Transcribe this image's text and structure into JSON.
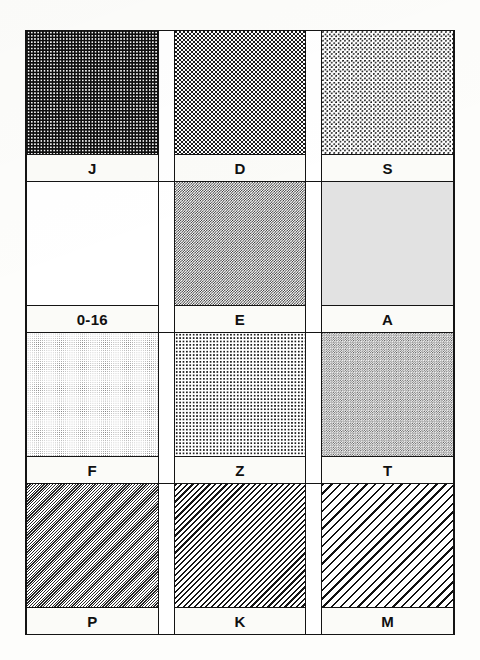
{
  "document": {
    "kind": "pattern-swatch-chart",
    "columns": 3,
    "rows": 4,
    "background_color": "#fdfdfb",
    "frame_color": "#141414",
    "label_band_color": "#fbfbf8",
    "label_text_color": "#101010"
  },
  "chart_data": {
    "type": "table",
    "title": "",
    "xlabel": "",
    "ylabel": "",
    "categories": [
      "J",
      "D",
      "S",
      "0-16",
      "E",
      "A",
      "F",
      "Z",
      "T",
      "P",
      "K",
      "M"
    ],
    "values": [
      78,
      48,
      28,
      16,
      50,
      12,
      20,
      22,
      18,
      46,
      44,
      30
    ],
    "series": [
      {
        "name": "ink coverage percent",
        "values": [
          78,
          48,
          28,
          16,
          50,
          12,
          20,
          22,
          18,
          46,
          44,
          30
        ]
      }
    ],
    "legend": [],
    "grid": true
  },
  "grid": {
    "rows": [
      {
        "row_index": 1,
        "cells": [
          {
            "label": "J",
            "pattern": "dense-coarse-checker-dot",
            "pattern_class": "pat-dense-checker",
            "coverage": 78
          },
          {
            "label": "D",
            "pattern": "medium-coarse-dot",
            "pattern_class": "pat-medium-dot",
            "coverage": 48
          },
          {
            "label": "S",
            "pattern": "light-coarse-dot",
            "pattern_class": "pat-light-dot",
            "coverage": 28
          }
        ]
      },
      {
        "row_index": 2,
        "cells": [
          {
            "label": "0-16",
            "pattern": "very-fine-pale-dot-grid",
            "pattern_class": "pat-fine-pale",
            "coverage": 16
          },
          {
            "label": "E",
            "pattern": "fine-mid-checker",
            "pattern_class": "pat-fine-checker",
            "coverage": 50
          },
          {
            "label": "A",
            "pattern": "ultra-fine-near-solid-gray",
            "pattern_class": "pat-ultrafine-gray",
            "coverage": 12
          }
        ]
      },
      {
        "row_index": 3,
        "cells": [
          {
            "label": "F",
            "pattern": "fine-light-gray-grid",
            "pattern_class": "pat-fine-lightgray",
            "coverage": 20
          },
          {
            "label": "Z",
            "pattern": "sparse-small-dot",
            "pattern_class": "pat-sparse-dot",
            "coverage": 22
          },
          {
            "label": "T",
            "pattern": "fine-light-checker",
            "pattern_class": "pat-fine-check-light",
            "coverage": 18
          }
        ]
      },
      {
        "row_index": 4,
        "cells": [
          {
            "label": "P",
            "pattern": "very-fine-diagonal-hatch",
            "pattern_class": "pat-fine-diagonal",
            "coverage": 46
          },
          {
            "label": "K",
            "pattern": "medium-diagonal-hatch",
            "pattern_class": "pat-med-diagonal",
            "coverage": 44
          },
          {
            "label": "M",
            "pattern": "coarse-diagonal-line-hatch",
            "pattern_class": "pat-coarse-diagonal",
            "coverage": 30
          }
        ]
      }
    ]
  }
}
